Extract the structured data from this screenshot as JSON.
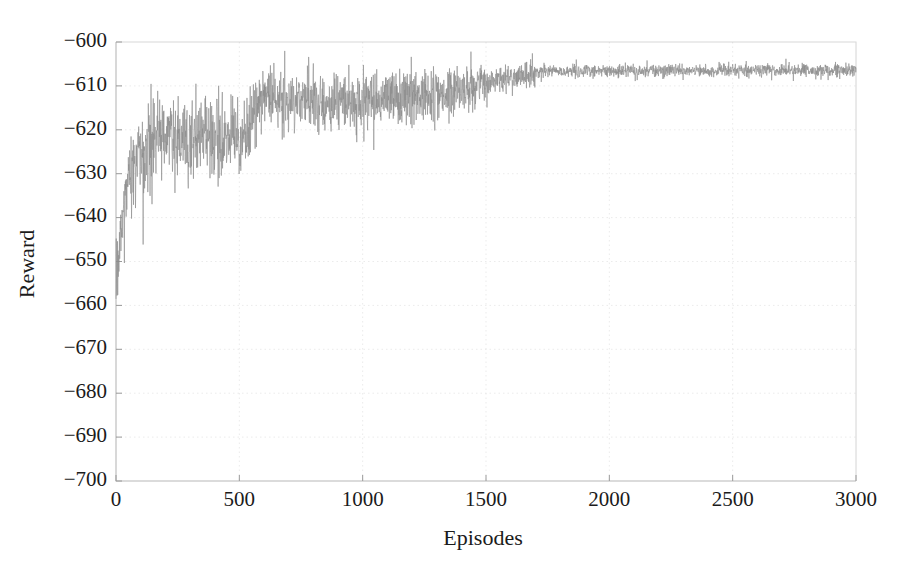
{
  "chart_data": {
    "type": "line",
    "title": "",
    "subtitle": "",
    "xlabel": "Episodes",
    "ylabel": "Reward",
    "xlim": [
      0,
      3000
    ],
    "ylim": [
      -700,
      -600
    ],
    "xticks": [
      0,
      500,
      1000,
      1500,
      2000,
      2500,
      3000
    ],
    "xtick_labels": [
      "0",
      "500",
      "1000",
      "1500",
      "2000",
      "2500",
      "3000"
    ],
    "yticks": [
      -700,
      -690,
      -680,
      -670,
      -660,
      -650,
      -640,
      -630,
      -620,
      -610,
      -600
    ],
    "ytick_labels": [
      "−700",
      "−690",
      "−680",
      "−670",
      "−660",
      "−650",
      "−640",
      "−630",
      "−620",
      "−610",
      "−600"
    ],
    "grid": "faint-dotted",
    "legend": "none",
    "annotations": [],
    "series": [
      {
        "name": "Reward per episode",
        "color": "#8c8c8c",
        "linewidth": 0.62,
        "description": "Noisy reinforcement-learning training reward curve: rapid rise from about -655 to -630 within the first 50 episodes, noisy band near -621 until about episode 540, a step improvement to about -613, gradual climb with shrinking noise to about -609 by episode 1500, then convergence to a tight plateau near -606.5 from episode 1700 to 3000.",
        "phases": [
          {
            "from": 0,
            "to": 50,
            "mean_start": -655.0,
            "mean_end": -631.0,
            "noise": 4.0
          },
          {
            "from": 50,
            "to": 140,
            "mean_start": -631.0,
            "mean_end": -621.5,
            "noise": 5.0
          },
          {
            "from": 140,
            "to": 540,
            "mean_start": -621.5,
            "mean_end": -620.5,
            "noise": 4.6
          },
          {
            "from": 540,
            "to": 575,
            "mean_start": -620.5,
            "mean_end": -612.8,
            "noise": 3.0
          },
          {
            "from": 575,
            "to": 900,
            "mean_start": -612.8,
            "mean_end": -613.5,
            "noise": 3.4
          },
          {
            "from": 900,
            "to": 1300,
            "mean_start": -613.5,
            "mean_end": -612.0,
            "noise": 3.2
          },
          {
            "from": 1300,
            "to": 1500,
            "mean_start": -612.0,
            "mean_end": -609.2,
            "noise": 2.2
          },
          {
            "from": 1500,
            "to": 1700,
            "mean_start": -609.2,
            "mean_end": -607.0,
            "noise": 1.5
          },
          {
            "from": 1700,
            "to": 3000,
            "mean_start": -606.6,
            "mean_end": -606.4,
            "noise": 0.75
          }
        ],
        "key_points": [
          {
            "x": 0,
            "y": -655.0
          },
          {
            "x": 25,
            "y": -641.0
          },
          {
            "x": 50,
            "y": -631.0
          },
          {
            "x": 100,
            "y": -625.0
          },
          {
            "x": 200,
            "y": -621.0
          },
          {
            "x": 300,
            "y": -620.5
          },
          {
            "x": 400,
            "y": -621.0
          },
          {
            "x": 500,
            "y": -620.0
          },
          {
            "x": 560,
            "y": -613.5
          },
          {
            "x": 700,
            "y": -613.0
          },
          {
            "x": 900,
            "y": -613.5
          },
          {
            "x": 1100,
            "y": -612.5
          },
          {
            "x": 1300,
            "y": -612.0
          },
          {
            "x": 1500,
            "y": -609.2
          },
          {
            "x": 1700,
            "y": -606.8
          },
          {
            "x": 2000,
            "y": -606.5
          },
          {
            "x": 2500,
            "y": -606.4
          },
          {
            "x": 3000,
            "y": -606.4
          }
        ]
      }
    ]
  },
  "figure": {
    "background_color": "#ffffff",
    "axis_color": "#b8b8b8",
    "text_color": "#1b1b1b",
    "curve_color": "#8c8c8c"
  }
}
